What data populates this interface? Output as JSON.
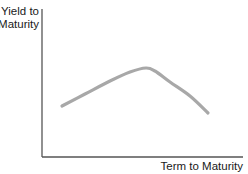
{
  "chart_data": {
    "type": "line",
    "title": "",
    "xlabel": "Term to Maturity",
    "ylabel_lines": [
      "Yield to",
      "Maturity"
    ],
    "ylabel": "Yield to Maturity",
    "grid": false,
    "legend": null,
    "x_ticks": [],
    "y_ticks": [],
    "series": [
      {
        "name": "Humped yield curve",
        "color": "#a8a8a8",
        "points": [
          {
            "x": 62,
            "y": 106
          },
          {
            "x": 85,
            "y": 94
          },
          {
            "x": 110,
            "y": 81
          },
          {
            "x": 130,
            "y": 72
          },
          {
            "x": 146,
            "y": 68
          },
          {
            "x": 155,
            "y": 71
          },
          {
            "x": 170,
            "y": 82
          },
          {
            "x": 190,
            "y": 96
          },
          {
            "x": 208,
            "y": 113
          }
        ]
      }
    ],
    "axes": {
      "color": "#555555",
      "x0": 42,
      "y0": 157,
      "x1": 243,
      "ytop": 9
    }
  }
}
